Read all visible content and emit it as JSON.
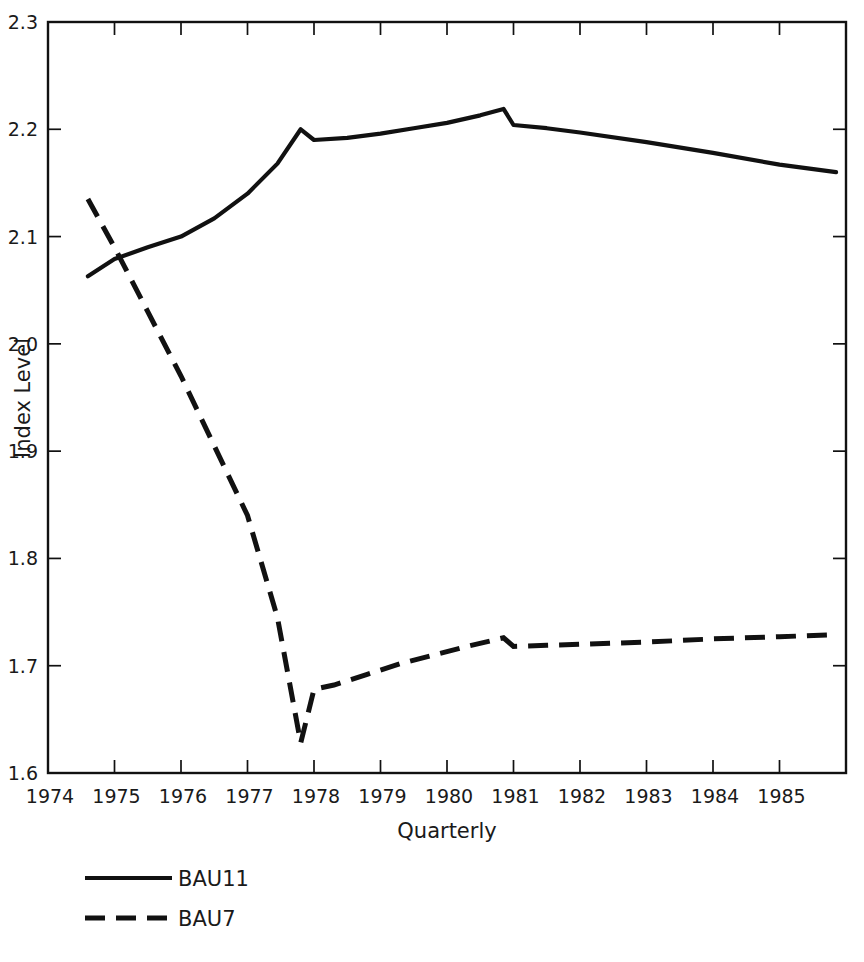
{
  "chart_data": {
    "type": "line",
    "title": "",
    "xlabel": "Quarterly",
    "ylabel": "Index Level",
    "xlim": [
      1974,
      1986
    ],
    "ylim": [
      1.6,
      2.3
    ],
    "grid": false,
    "legend_position": "bottom-left",
    "x_tick_labels": [
      "1974",
      "1975",
      "1976",
      "1977",
      "1978",
      "1979",
      "1980",
      "1981",
      "1982",
      "1983",
      "1984",
      "1985"
    ],
    "x_tick_values": [
      1974,
      1975,
      1976,
      1977,
      1978,
      1979,
      1980,
      1981,
      1982,
      1983,
      1984,
      1985
    ],
    "y_tick_labels": [
      "1.6",
      "1.7",
      "1.8",
      "1.9",
      "2.0",
      "2.1",
      "2.2",
      "2.3"
    ],
    "y_tick_values": [
      1.6,
      1.7,
      1.8,
      1.9,
      2.0,
      2.1,
      2.2,
      2.3
    ],
    "series": [
      {
        "name": "BAU11",
        "style": "solid",
        "color": "#111111",
        "x": [
          1974.6,
          1975.0,
          1975.5,
          1976.0,
          1976.5,
          1977.0,
          1977.45,
          1977.8,
          1978.0,
          1978.5,
          1979.0,
          1979.5,
          1980.0,
          1980.5,
          1980.85,
          1981.0,
          1981.5,
          1982.0,
          1983.0,
          1984.0,
          1985.0,
          1985.85
        ],
        "values": [
          2.063,
          2.079,
          2.09,
          2.1,
          2.117,
          2.14,
          2.168,
          2.2,
          2.19,
          2.192,
          2.196,
          2.201,
          2.206,
          2.213,
          2.219,
          2.204,
          2.201,
          2.197,
          2.188,
          2.178,
          2.167,
          2.16
        ]
      },
      {
        "name": "BAU7",
        "style": "dashed",
        "color": "#111111",
        "x": [
          1974.6,
          1975.0,
          1975.5,
          1976.0,
          1976.5,
          1977.0,
          1977.45,
          1977.8,
          1978.0,
          1978.3,
          1978.8,
          1979.3,
          1979.8,
          1980.3,
          1980.85,
          1981.0,
          1981.5,
          1982.0,
          1983.0,
          1984.0,
          1985.0,
          1985.85
        ],
        "values": [
          2.135,
          2.09,
          2.03,
          1.97,
          1.905,
          1.84,
          1.745,
          1.628,
          1.678,
          1.682,
          1.692,
          1.702,
          1.71,
          1.718,
          1.726,
          1.718,
          1.719,
          1.72,
          1.722,
          1.725,
          1.727,
          1.729
        ]
      }
    ],
    "legend": [
      {
        "label": "BAU11",
        "style": "solid"
      },
      {
        "label": "BAU7",
        "style": "dashed"
      }
    ]
  },
  "axes": {
    "y_title": "Index Level",
    "x_title": "Quarterly"
  },
  "ticks": {
    "y": [
      {
        "label": "2.3",
        "value": 2.3
      },
      {
        "label": "2.2",
        "value": 2.2
      },
      {
        "label": "2.1",
        "value": 2.1
      },
      {
        "label": "2.0",
        "value": 2.0
      },
      {
        "label": "1.9",
        "value": 1.9
      },
      {
        "label": "1.8",
        "value": 1.8
      },
      {
        "label": "1.7",
        "value": 1.7
      },
      {
        "label": "1.6",
        "value": 1.6
      }
    ],
    "x": [
      {
        "label": "1974",
        "value": 1974
      },
      {
        "label": "1975",
        "value": 1975
      },
      {
        "label": "1976",
        "value": 1976
      },
      {
        "label": "1977",
        "value": 1977
      },
      {
        "label": "1978",
        "value": 1978
      },
      {
        "label": "1979",
        "value": 1979
      },
      {
        "label": "1980",
        "value": 1980
      },
      {
        "label": "1981",
        "value": 1981
      },
      {
        "label": "1982",
        "value": 1982
      },
      {
        "label": "1983",
        "value": 1983
      },
      {
        "label": "1984",
        "value": 1984
      },
      {
        "label": "1985",
        "value": 1985
      }
    ]
  },
  "legend": {
    "items": [
      {
        "label": "BAU11"
      },
      {
        "label": "BAU7"
      }
    ]
  },
  "colors": {
    "line": "#111111",
    "text": "#1a1a1a",
    "background": "#ffffff"
  }
}
